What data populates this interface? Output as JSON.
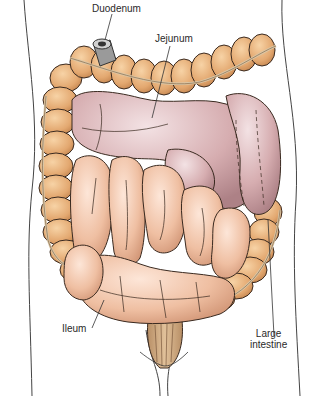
{
  "labels": {
    "duodenum": "Duodenum",
    "jejunum": "Jejunum",
    "ileum": "Ileum",
    "large_intestine_line1": "Large",
    "large_intestine_line2": "intestine"
  },
  "colors": {
    "colon": "#e8b37d",
    "colon_shadow": "#c98c55",
    "small_intestine": "#f0c4a8",
    "jejunum": "#d8b2b4",
    "outline": "#3a2a20",
    "body_outline": "#444444",
    "label_text": "#2a2a2a"
  }
}
